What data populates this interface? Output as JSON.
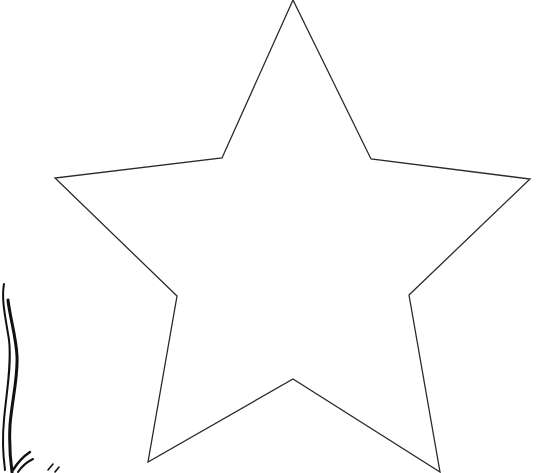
{
  "image": {
    "width": 538,
    "height": 473,
    "background": "#ffffff",
    "stroke_color": "#2a2a2a"
  },
  "star": {
    "label": "five-point star outline",
    "points": [
      [
        293,
        0
      ],
      [
        371,
        159
      ],
      [
        530,
        179
      ],
      [
        409,
        295
      ],
      [
        440,
        472
      ],
      [
        293,
        379
      ],
      [
        148,
        462
      ],
      [
        177,
        296
      ],
      [
        55,
        178
      ],
      [
        222,
        158
      ]
    ]
  },
  "ribbon": {
    "label": "curly ribbon fragment"
  }
}
